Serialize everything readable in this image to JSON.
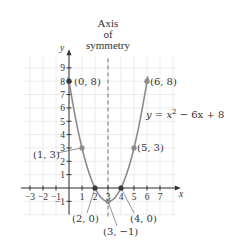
{
  "chart_data": {
    "type": "line",
    "title": "",
    "annotation_title": [
      "Axis",
      "of",
      "symmetry"
    ],
    "equation_label": "y = x² − 6x + 8",
    "equation_parts": {
      "y": "y",
      "eq": " = ",
      "x": "x",
      "sup": "2",
      "rest": " − 6x + 8"
    },
    "xlabel": "x",
    "ylabel": "y",
    "xlim": [
      -3.5,
      8.5
    ],
    "ylim": [
      -2,
      10
    ],
    "grid": true,
    "x_ticks": [
      -3,
      -2,
      -1,
      1,
      2,
      3,
      4,
      5,
      6,
      7
    ],
    "x_tick_labels": [
      "−3",
      "−2",
      "−1",
      "1",
      "2",
      "3",
      "4",
      "5",
      "6",
      "7"
    ],
    "y_ticks": [
      -1,
      1,
      2,
      3,
      4,
      5,
      6,
      7,
      8,
      9
    ],
    "y_tick_labels": [
      "−1",
      "1",
      "2",
      "3",
      "4",
      "5",
      "6",
      "7",
      "8",
      "9"
    ],
    "axis_of_symmetry": 3,
    "series": [
      {
        "name": "y = x^2 - 6x + 8",
        "function": "x^2 - 6x + 8",
        "x_range": [
          -0.05,
          6.05
        ]
      }
    ],
    "points": [
      {
        "x": 0,
        "y": 8,
        "label": "(0, 8)",
        "style": "dark"
      },
      {
        "x": 6,
        "y": 8,
        "label": "(6, 8)",
        "style": "gray"
      },
      {
        "x": 1,
        "y": 3,
        "label": "(1, 3)",
        "style": "gray"
      },
      {
        "x": 5,
        "y": 3,
        "label": "(5, 3)",
        "style": "gray"
      },
      {
        "x": 2,
        "y": 0,
        "label": "(2, 0)",
        "style": "dark"
      },
      {
        "x": 4,
        "y": 0,
        "label": "(4, 0)",
        "style": "dark"
      },
      {
        "x": 3,
        "y": -1,
        "label": "(3, −1)",
        "style": "gray"
      }
    ],
    "colors": {
      "curve": "#8a8a8a",
      "axis": "#333333",
      "grid": "#e6e6e6",
      "dashed": "#8a8a8a",
      "point_dark": "#3a3a3a",
      "point_gray": "#8c8c8c",
      "text": "#333333"
    }
  }
}
